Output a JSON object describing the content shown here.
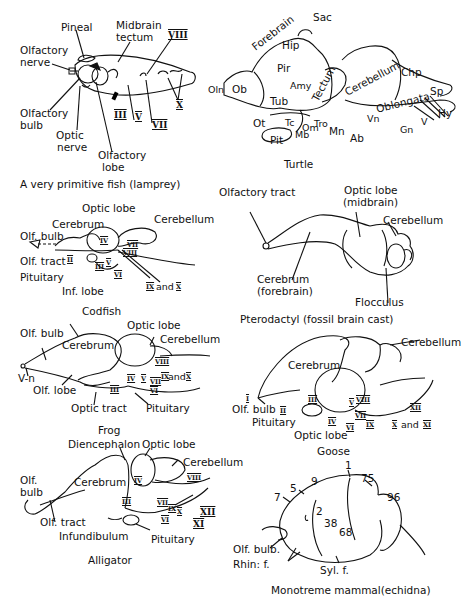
{
  "figure": {
    "panels": [
      {
        "id": "lamprey",
        "caption": "A very primitive fish (lamprey)",
        "labels": {
          "pineal": "Pineal",
          "midbrain_tectum_1": "Midbrain",
          "midbrain_tectum_2": "tectum",
          "olfactory_nerve_1": "Olfactory",
          "olfactory_nerve_2": "nerve",
          "olfactory_bulb_1": "Olfactory",
          "olfactory_bulb_2": "bulb",
          "optic_nerve_1": "Optic",
          "optic_nerve_2": "nerve",
          "olfactory_lobe_1": "Olfactory",
          "olfactory_lobe_2": "lobe",
          "cn_iii": "III",
          "cn_v": "V",
          "cn_vii": "VII",
          "cn_viii": "VIII",
          "cn_x": "X"
        }
      },
      {
        "id": "turtle",
        "caption": "Turtle",
        "labels": {
          "sac": "Sac",
          "forebrain": "Forebrain",
          "hip": "Hip",
          "pir": "Pir",
          "amy": "Amy",
          "tectum": "Tectum",
          "cerebellum": "Cerebellum",
          "chp": "Chp",
          "oblongata": "Oblongata",
          "sp": "Sp",
          "hy": "Hy",
          "oln": "Oln",
          "ob": "Ob",
          "tub": "Tub",
          "ot": "Ot",
          "tc": "Tc",
          "om": "Om",
          "tro": "Tro",
          "mb": "Mb",
          "pit": "Pit",
          "mn": "Mn",
          "ab": "Ab",
          "vn": "Vn",
          "gn": "Gn",
          "v": "V"
        }
      },
      {
        "id": "codfish",
        "caption": "Codfish",
        "labels": {
          "optic_lobe": "Optic lobe",
          "cerebrum": "Cerebrum",
          "cerebellum": "Cerebellum",
          "olf_bulb": "Olf. bulb",
          "olf_tract": "Olf. tract",
          "pituitary": "Pituitary",
          "inf_lobe": "Inf. lobe",
          "cn_ii": "II",
          "cn_iii": "III",
          "cn_iv": "IV",
          "cn_v": "V",
          "cn_vi": "VI",
          "cn_vii": "VII",
          "cn_viii": "VIII",
          "cn_ix_x_a": "IX",
          "cn_ix_x_and": "and",
          "cn_ix_x_b": "X"
        }
      },
      {
        "id": "pterodactyl",
        "caption": "Pterodactyl (fossil brain cast)",
        "labels": {
          "olfactory_tract": "Olfactory tract",
          "optic_lobe_1": "Optic lobe",
          "optic_lobe_2": "(midbrain)",
          "cerebellum": "Cerebellum",
          "cerebrum_1": "Cerebrum",
          "cerebrum_2": "(forebrain)",
          "flocculus": "Flocculus"
        }
      },
      {
        "id": "frog",
        "caption": "Frog",
        "labels": {
          "olf_bulb": "Olf. bulb",
          "cerebrum": "Cerebrum",
          "optic_lobe": "Optic lobe",
          "cerebellum": "Cerebellum",
          "v_n": "V-n",
          "olf_lobe": "Olf. lobe",
          "optic_tract": "Optic tract",
          "pituitary": "Pituitary",
          "cn_iii": "III",
          "cn_iv": "IV",
          "cn_v": "V",
          "cn_vi": "VI",
          "cn_vii": "VII",
          "cn_viii": "VIII",
          "cn_ix_x_a": "IX",
          "cn_ix_x_and": "and",
          "cn_ix_x_b": "X"
        }
      },
      {
        "id": "goose",
        "caption": "Goose",
        "labels": {
          "cerebellum": "Cerebellum",
          "cerebrum": "Cerebrum",
          "olf_bulb": "Olf. bulb",
          "pituitary": "Pituitary",
          "optic_lobe": "Optic lobe",
          "cn_i": "I",
          "cn_ii": "II",
          "cn_iii": "III",
          "cn_iv": "IV",
          "cn_v": "V",
          "cn_vi": "VI",
          "cn_vii": "VII",
          "cn_viii": "VIII",
          "cn_ix": "IX",
          "cn_x_xi_a": "X",
          "cn_x_xi_and": "and",
          "cn_x_xi_b": "XI",
          "cn_xii": "XII"
        }
      },
      {
        "id": "alligator",
        "caption": "Alligator",
        "labels": {
          "diencephalon": "Diencephalon",
          "optic_lobe": "Optic lobe",
          "cerebellum": "Cerebellum",
          "olf_bulb_1": "Olf.",
          "olf_bulb_2": "bulb",
          "cerebrum": "Cerebrum",
          "olf_tract": "Olf. tract",
          "infundibulum": "Infundibulum",
          "pituitary": "Pituitary",
          "cn_iii": "III",
          "cn_iv": "IV",
          "cn_vi": "VI",
          "cn_vii": "VII",
          "cn_viii": "VIII",
          "cn_ix": "IX",
          "cn_x": "X",
          "cn_xi": "XI",
          "cn_xii": "XII"
        }
      },
      {
        "id": "echidna",
        "caption": "Monotreme mammal(echidna)",
        "labels": {
          "area_1": "1",
          "area_2": "2",
          "area_5": "5",
          "area_7": "7",
          "area_9": "9",
          "area_38": "38",
          "area_68": "68",
          "area_75": "75",
          "area_96": "96",
          "olf_bulb": "Olf. bulb.",
          "rhin_f": "Rhin: f.",
          "syl_f": "Syl. f."
        }
      }
    ]
  }
}
